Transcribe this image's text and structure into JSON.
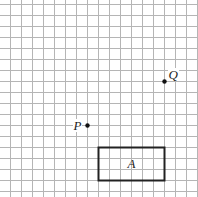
{
  "diagram": {
    "type": "grid-geometry",
    "grid": {
      "cell_size_px": 11,
      "origin_x_px": 10,
      "origin_y_px": 4,
      "columns": 18,
      "rows": 18,
      "line_color": "#b5b5b5"
    },
    "points": [
      {
        "label": "P",
        "grid_x": 7,
        "grid_y": 11,
        "label_side": "left"
      },
      {
        "label": "Q",
        "grid_x": 14,
        "grid_y": 7,
        "label_side": "upper-right"
      }
    ],
    "shapes": [
      {
        "label": "A",
        "kind": "rectangle",
        "grid_x": 8,
        "grid_y": 13,
        "width_cells": 6,
        "height_cells": 3,
        "stroke": "#222222"
      }
    ]
  },
  "labels": {
    "p": "P",
    "q": "Q",
    "a": "A"
  }
}
